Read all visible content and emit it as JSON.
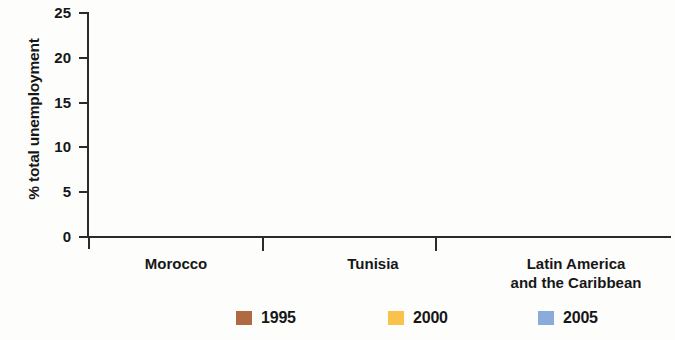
{
  "chart_data": {
    "type": "bar",
    "title": "",
    "subtitle": "",
    "xlabel": "",
    "ylabel": "% total unemployment",
    "ylim": [
      0,
      25
    ],
    "yticks": [
      0,
      5,
      10,
      15,
      20,
      25
    ],
    "ytick_labels": [
      "0",
      "5",
      "10",
      "15",
      "20",
      "25"
    ],
    "grid": false,
    "legend_position": "bottom-center",
    "categories": [
      "Morocco",
      "Tunisia",
      "Latin America\nand the Caribbean"
    ],
    "series": [
      {
        "name": "1995",
        "color": "#b06a42",
        "values": [
          13.3,
          1.7,
          null
        ]
      },
      {
        "name": "2000",
        "color": "#f9c24b",
        "values": [
          18.0,
          6.5,
          10.9
        ]
      },
      {
        "name": "2005",
        "color": "#8babdd",
        "values": [
          21.6,
          13.5,
          12.4
        ]
      }
    ]
  },
  "axis": {
    "y_title": "% total unemployment",
    "ticks": [
      {
        "label": "25",
        "value": 25
      },
      {
        "label": "20",
        "value": 20
      },
      {
        "label": "15",
        "value": 15
      },
      {
        "label": "10",
        "value": 10
      },
      {
        "label": "5",
        "value": 5
      },
      {
        "label": "0",
        "value": 0
      }
    ]
  },
  "categories": [
    {
      "label": "Morocco"
    },
    {
      "label": "Tunisia"
    },
    {
      "label": "Latin America\nand the Caribbean"
    }
  ],
  "legend": {
    "items": [
      {
        "label": "1995",
        "color": "#b06a42"
      },
      {
        "label": "2000",
        "color": "#f9c24b"
      },
      {
        "label": "2005",
        "color": "#8babdd"
      }
    ]
  }
}
